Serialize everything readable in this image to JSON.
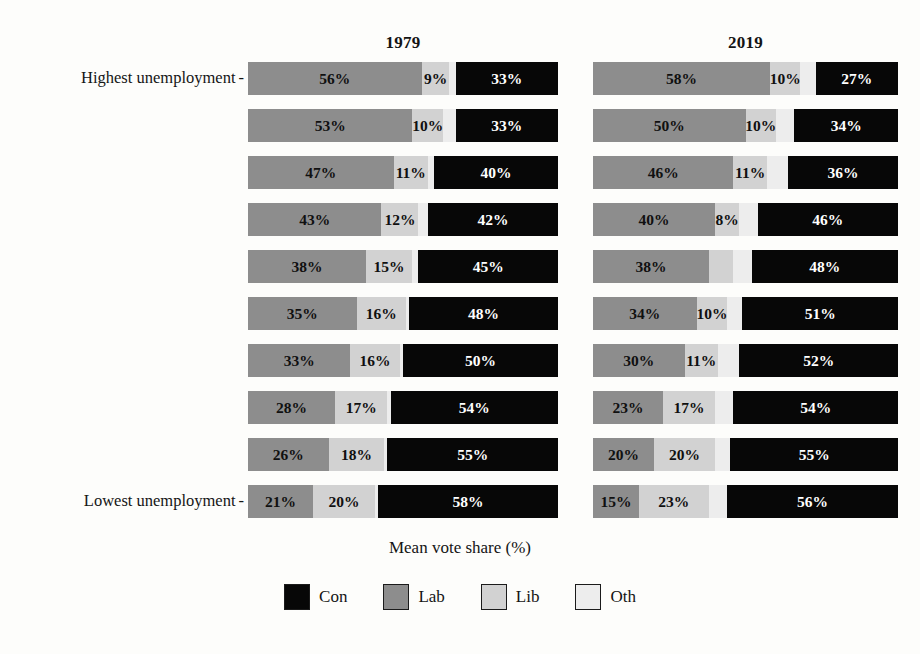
{
  "chart_data": {
    "type": "bar",
    "subtype": "horizontal-stacked-bar",
    "title": "",
    "xlabel": "Mean vote share (%)",
    "ylabel": "",
    "xlim": [
      0,
      100
    ],
    "grid": false,
    "legend_position": "bottom",
    "orientation": "horizontal",
    "stack_order": [
      "Lab",
      "Lib",
      "Oth",
      "Con"
    ],
    "panels": [
      {
        "name": "1979",
        "rows": [
          {
            "ytick": "Highest unemployment",
            "Lab": 56,
            "Lib": 9,
            "Oth": 2,
            "Con": 33,
            "labels": {
              "Lab": "56%",
              "Lib": "9%",
              "Oth": "",
              "Con": "33%"
            }
          },
          {
            "ytick": "",
            "Lab": 53,
            "Lib": 10,
            "Oth": 4,
            "Con": 33,
            "labels": {
              "Lab": "53%",
              "Lib": "10%",
              "Oth": "",
              "Con": "33%"
            }
          },
          {
            "ytick": "",
            "Lab": 47,
            "Lib": 11,
            "Oth": 2,
            "Con": 40,
            "labels": {
              "Lab": "47%",
              "Lib": "11%",
              "Oth": "",
              "Con": "40%"
            }
          },
          {
            "ytick": "",
            "Lab": 43,
            "Lib": 12,
            "Oth": 3,
            "Con": 42,
            "labels": {
              "Lab": "43%",
              "Lib": "12%",
              "Oth": "",
              "Con": "42%"
            }
          },
          {
            "ytick": "",
            "Lab": 38,
            "Lib": 15,
            "Oth": 2,
            "Con": 45,
            "labels": {
              "Lab": "38%",
              "Lib": "15%",
              "Oth": "",
              "Con": "45%"
            }
          },
          {
            "ytick": "",
            "Lab": 35,
            "Lib": 16,
            "Oth": 1,
            "Con": 48,
            "labels": {
              "Lab": "35%",
              "Lib": "16%",
              "Oth": "",
              "Con": "48%"
            }
          },
          {
            "ytick": "",
            "Lab": 33,
            "Lib": 16,
            "Oth": 1,
            "Con": 50,
            "labels": {
              "Lab": "33%",
              "Lib": "16%",
              "Oth": "",
              "Con": "50%"
            }
          },
          {
            "ytick": "",
            "Lab": 28,
            "Lib": 17,
            "Oth": 1,
            "Con": 54,
            "labels": {
              "Lab": "28%",
              "Lib": "17%",
              "Oth": "",
              "Con": "54%"
            }
          },
          {
            "ytick": "",
            "Lab": 26,
            "Lib": 18,
            "Oth": 1,
            "Con": 55,
            "labels": {
              "Lab": "26%",
              "Lib": "18%",
              "Oth": "",
              "Con": "55%"
            }
          },
          {
            "ytick": "Lowest unemployment",
            "Lab": 21,
            "Lib": 20,
            "Oth": 1,
            "Con": 58,
            "labels": {
              "Lab": "21%",
              "Lib": "20%",
              "Oth": "",
              "Con": "58%"
            }
          }
        ]
      },
      {
        "name": "2019",
        "rows": [
          {
            "ytick": "",
            "Lab": 58,
            "Lib": 10,
            "Oth": 5,
            "Con": 27,
            "labels": {
              "Lab": "58%",
              "Lib": "10%",
              "Oth": "",
              "Con": "27%"
            }
          },
          {
            "ytick": "",
            "Lab": 50,
            "Lib": 10,
            "Oth": 6,
            "Con": 34,
            "labels": {
              "Lab": "50%",
              "Lib": "10%",
              "Oth": "",
              "Con": "34%"
            }
          },
          {
            "ytick": "",
            "Lab": 46,
            "Lib": 11,
            "Oth": 7,
            "Con": 36,
            "labels": {
              "Lab": "46%",
              "Lib": "11%",
              "Oth": "",
              "Con": "36%"
            }
          },
          {
            "ytick": "",
            "Lab": 40,
            "Lib": 8,
            "Oth": 6,
            "Con": 46,
            "labels": {
              "Lab": "40%",
              "Lib": "8%",
              "Oth": "",
              "Con": "46%"
            }
          },
          {
            "ytick": "",
            "Lab": 38,
            "Lib": 8,
            "Oth": 6,
            "Con": 48,
            "labels": {
              "Lab": "38%",
              "Lib": "",
              "Oth": "",
              "Con": "48%"
            }
          },
          {
            "ytick": "",
            "Lab": 34,
            "Lib": 10,
            "Oth": 5,
            "Con": 51,
            "labels": {
              "Lab": "34%",
              "Lib": "10%",
              "Oth": "",
              "Con": "51%"
            }
          },
          {
            "ytick": "",
            "Lab": 30,
            "Lib": 11,
            "Oth": 7,
            "Con": 52,
            "labels": {
              "Lab": "30%",
              "Lib": "11%",
              "Oth": "",
              "Con": "52%"
            }
          },
          {
            "ytick": "",
            "Lab": 23,
            "Lib": 17,
            "Oth": 6,
            "Con": 54,
            "labels": {
              "Lab": "23%",
              "Lib": "17%",
              "Oth": "",
              "Con": "54%"
            }
          },
          {
            "ytick": "",
            "Lab": 20,
            "Lib": 20,
            "Oth": 5,
            "Con": 55,
            "labels": {
              "Lab": "20%",
              "Lib": "20%",
              "Oth": "",
              "Con": "55%"
            }
          },
          {
            "ytick": "",
            "Lab": 15,
            "Lib": 23,
            "Oth": 6,
            "Con": 56,
            "labels": {
              "Lab": "15%",
              "Lib": "23%",
              "Oth": "",
              "Con": "56%"
            }
          }
        ]
      }
    ],
    "legend": [
      {
        "label": "Con",
        "color": "#070707"
      },
      {
        "label": "Lab",
        "color": "#8d8d8d"
      },
      {
        "label": "Lib",
        "color": "#d2d2d2"
      },
      {
        "label": "Oth",
        "color": "#ededed"
      }
    ],
    "ytick_labels": {
      "top": "Highest unemployment",
      "bottom": "Lowest unemployment",
      "dash": "-"
    }
  },
  "layout": {
    "panel_left_x": 248,
    "panel_left_width": 310,
    "panel_right_x": 593,
    "panel_right_width": 305,
    "first_row_y": 62,
    "row_step": 47,
    "bar_height": 33
  }
}
